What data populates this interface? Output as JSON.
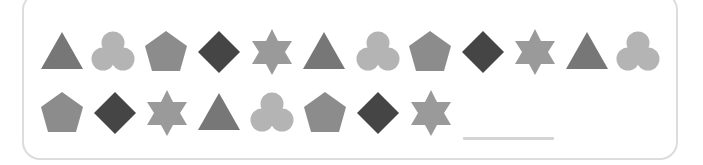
{
  "puzzle": {
    "pattern_unit": [
      "triangle",
      "trefoil",
      "pentagon",
      "diamond",
      "star"
    ],
    "colors": {
      "triangle": "#777777",
      "trefoil": "#b4b4b4",
      "pentagon": "#8c8c8c",
      "diamond": "#454545",
      "star": "#9a9a9a",
      "frame_border": "#dcdcdc",
      "answer_line": "#d4d4d4"
    },
    "rows": [
      {
        "y": 52,
        "shapes": [
          {
            "type": "triangle",
            "x": 62
          },
          {
            "type": "trefoil",
            "x": 113
          },
          {
            "type": "pentagon",
            "x": 166
          },
          {
            "type": "diamond",
            "x": 219
          },
          {
            "type": "star",
            "x": 272
          },
          {
            "type": "triangle",
            "x": 324
          },
          {
            "type": "trefoil",
            "x": 378
          },
          {
            "type": "pentagon",
            "x": 430
          },
          {
            "type": "diamond",
            "x": 483
          },
          {
            "type": "star",
            "x": 535
          },
          {
            "type": "triangle",
            "x": 587
          },
          {
            "type": "trefoil",
            "x": 638
          }
        ]
      },
      {
        "y": 113,
        "shapes": [
          {
            "type": "pentagon",
            "x": 62
          },
          {
            "type": "diamond",
            "x": 115
          },
          {
            "type": "star",
            "x": 167
          },
          {
            "type": "triangle",
            "x": 219
          },
          {
            "type": "trefoil",
            "x": 272
          },
          {
            "type": "pentagon",
            "x": 325
          },
          {
            "type": "diamond",
            "x": 378
          },
          {
            "type": "star",
            "x": 431
          }
        ]
      }
    ],
    "answer_blank": {
      "value": "",
      "x": 463,
      "y": 139,
      "width": 91
    }
  }
}
